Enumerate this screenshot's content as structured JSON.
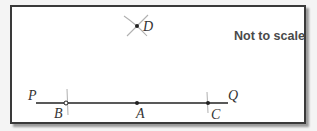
{
  "note": "Not to scale",
  "colors": {
    "frame": "#3a3a3a",
    "line": "#222222",
    "arc": "#b0b0b0",
    "note_text": "#4a4a4a"
  },
  "points": {
    "P": {
      "label": "P",
      "x": 36,
      "y": 103
    },
    "Q": {
      "label": "Q",
      "x": 228,
      "y": 103
    },
    "A": {
      "label": "A",
      "x": 137,
      "y": 103
    },
    "B": {
      "label": "B",
      "x": 66,
      "y": 103
    },
    "C": {
      "label": "C",
      "x": 208,
      "y": 103
    },
    "D": {
      "label": "D",
      "x": 137,
      "y": 26
    }
  }
}
